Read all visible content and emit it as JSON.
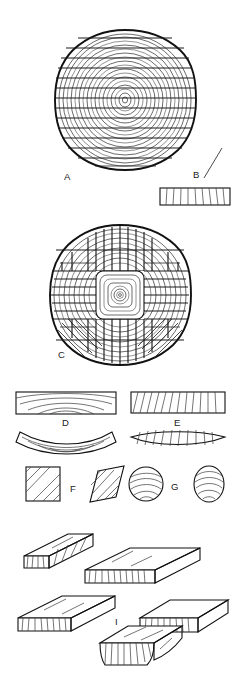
{
  "figure": {
    "background_color": "#ffffff",
    "ink_color": "#1a1a1a",
    "width": 238,
    "height": 685,
    "style": "line drawing"
  },
  "labels": {
    "a": "A",
    "b": "B",
    "c": "C",
    "d": "D",
    "e": "E",
    "f": "F",
    "g": "G",
    "h": "H",
    "i": "I"
  },
  "panels": [
    {
      "id": "A",
      "label": "A",
      "caption": "A",
      "type": "log-cross-section",
      "description": "Log end grain with concentric growth rings cut through-and-through by parallel horizontal saw lines",
      "center": [
        125,
        100
      ],
      "radius": 70,
      "ring_count": 17,
      "saw_line_count": 14,
      "saw_direction": "horizontal"
    },
    {
      "id": "B",
      "label": "B",
      "caption": "B",
      "type": "board-end-section",
      "description": "Single flat-sawn board end section with near-vertical grain lines",
      "rect": [
        160,
        188,
        70,
        17
      ],
      "grain_line_count": 9,
      "leader_line": [
        [
          205,
          172
        ],
        [
          222,
          150
        ]
      ]
    },
    {
      "id": "C",
      "label": "C",
      "caption": "C",
      "type": "log-cross-section",
      "description": "Log end grain quarter-sawn: boxed-heart square centre with concentric rings, flanked by four radial sawn quadrants and angled corner cuts",
      "center": [
        120,
        295
      ],
      "radius": 70,
      "ring_count": 16,
      "core_box": [
        96,
        271,
        48,
        48
      ],
      "core_ring_count": 8,
      "saw_direction": "radial-quarter"
    },
    {
      "id": "D",
      "label": "D",
      "caption": "D",
      "type": "board-distortion",
      "description": "Flat-sawn (tangential) board with arched growth rings, shown before and after cupping away from the heart",
      "before_rect": [
        16,
        392,
        100,
        22
      ],
      "after_description": "cupped board, concave upper face"
    },
    {
      "id": "E",
      "label": "E",
      "caption": "E",
      "type": "board-distortion",
      "description": "Quarter-sawn (radial) board with steep vertical grain, shown before and after drying with only slight thickness loss",
      "before_rect": [
        131,
        392,
        94,
        21
      ],
      "after_description": "board thins slightly and tapers at ends"
    },
    {
      "id": "F",
      "label": "F",
      "caption": "F",
      "type": "section-distortion",
      "description": "Square section with diagonal grain distorting into a rhomboid (diamonding)",
      "before_shape": "square",
      "after_shape": "rhomboid"
    },
    {
      "id": "G",
      "label": "G",
      "caption": "G",
      "type": "section-distortion",
      "description": "Round section with curved grain distorting into an oval",
      "before_shape": "circle",
      "after_shape": "oval"
    },
    {
      "id": "H",
      "label": "H",
      "caption": "H",
      "type": "isometric-boards",
      "description": "Two isometric boards shown end to end with visible end-grain lines, illustrating flat-sawn board behaviour",
      "board_count": 2
    },
    {
      "id": "I",
      "label": "I",
      "caption": "I",
      "type": "isometric-boards",
      "description": "Three isometric boards, the lower centre board cupped across its width",
      "board_count": 3
    }
  ],
  "colors": {
    "ink": "#1a1a1a",
    "ring_stroke": "#2b2b2b",
    "saw_stroke": "#1b1b1b",
    "grain_stroke": "#3a3a3a",
    "background": "#ffffff"
  }
}
